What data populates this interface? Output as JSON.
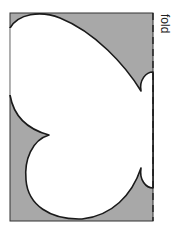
{
  "diagram": {
    "type": "folded paper cutout (half butterfly)",
    "fold_label": "fold",
    "colors": {
      "paper_fill": "#a8a8a8",
      "cutout_fill": "#ffffff",
      "outline": "#1a1a1a"
    }
  }
}
